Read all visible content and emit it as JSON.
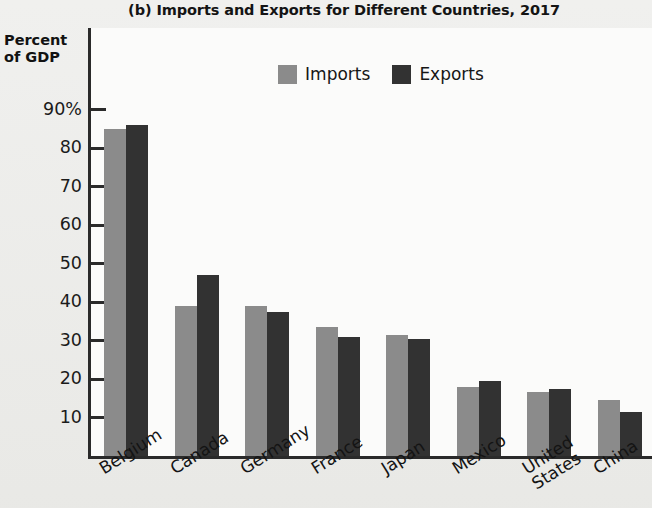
{
  "title": "(b) Imports and Exports for Different Countries, 2017",
  "y_axis_title_line1": "Percent",
  "y_axis_title_line2": "of GDP",
  "legend": [
    {
      "label": "Imports",
      "color": "#8b8b8b"
    },
    {
      "label": "Exports",
      "color": "#323232"
    }
  ],
  "colors": {
    "imports": "#8b8b8b",
    "exports": "#323232",
    "axis": "#2a2a2a",
    "plot_background": "#fbfbfa",
    "page_background": "#e8e8e5"
  },
  "y_ticks": [
    "90%",
    "80",
    "70",
    "60",
    "50",
    "40",
    "30",
    "20",
    "10"
  ],
  "chart_data": {
    "type": "bar",
    "title": "(b) Imports and Exports for Different Countries, 2017",
    "xlabel": "",
    "ylabel": "Percent of GDP",
    "ylim": [
      0,
      95
    ],
    "ytick_values": [
      10,
      20,
      30,
      40,
      50,
      60,
      70,
      80,
      90
    ],
    "ytick_labels": [
      "10",
      "20",
      "30",
      "40",
      "50",
      "60",
      "70",
      "80",
      "90%"
    ],
    "grid": false,
    "legend_position": "top-right",
    "categories": [
      "Belgium",
      "Canada",
      "Germany",
      "France",
      "Japan",
      "Mexico",
      "United States",
      "China"
    ],
    "category_labels": [
      [
        "Belgium"
      ],
      [
        "Canada"
      ],
      [
        "Germany"
      ],
      [
        "France"
      ],
      [
        "Japan"
      ],
      [
        "Mexico"
      ],
      [
        "United",
        "States"
      ],
      [
        "China"
      ]
    ],
    "series": [
      {
        "name": "Imports",
        "color": "#8b8b8b",
        "values": [
          85,
          39,
          39,
          33.5,
          31.5,
          18,
          16.5,
          14.5
        ]
      },
      {
        "name": "Exports",
        "color": "#323232",
        "values": [
          86,
          47,
          37.5,
          31,
          30.5,
          19.5,
          17.5,
          11.5
        ]
      }
    ]
  }
}
